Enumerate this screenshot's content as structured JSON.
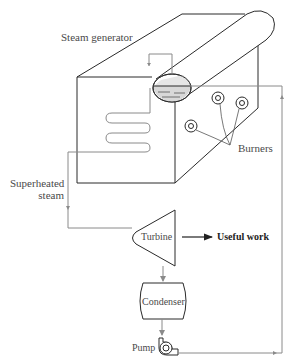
{
  "diagram": {
    "labels": {
      "steam_generator": "Steam generator",
      "burners": "Burners",
      "superheated_steam_line1": "Superheated",
      "superheated_steam_line2": "steam",
      "turbine": "Turbine",
      "useful_work": "Useful work",
      "condenser": "Condenser",
      "pump": "Pump"
    },
    "components": [
      {
        "id": "steam-generator",
        "label": "Steam generator",
        "shape": "box-with-drum"
      },
      {
        "id": "burners",
        "label": "Burners",
        "count": 3
      },
      {
        "id": "superheater-coil",
        "label": "",
        "shape": "serpentine"
      },
      {
        "id": "turbine",
        "label": "Turbine",
        "shape": "trapezoid"
      },
      {
        "id": "condenser",
        "label": "Condenser",
        "shape": "barrel"
      },
      {
        "id": "pump",
        "label": "Pump",
        "shape": "pump-symbol"
      }
    ],
    "flows": [
      {
        "from": "steam-generator",
        "to": "turbine",
        "label": "Superheated steam"
      },
      {
        "from": "turbine",
        "to": "useful-work",
        "label": "Useful work"
      },
      {
        "from": "turbine",
        "to": "condenser",
        "label": ""
      },
      {
        "from": "condenser",
        "to": "pump",
        "label": ""
      },
      {
        "from": "pump",
        "to": "steam-generator",
        "label": ""
      }
    ],
    "colors": {
      "line": "#2a2a2a",
      "pipe": "#8a8a8a",
      "water": "#d8d8d8",
      "text": "#4a4a4a"
    }
  }
}
